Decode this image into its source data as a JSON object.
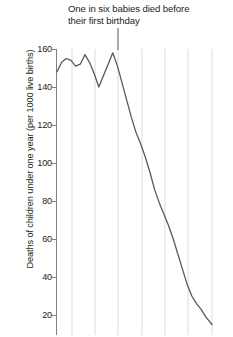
{
  "chart_data": {
    "type": "line",
    "title": "One in six babies died before their first birthday",
    "xlabel": "",
    "ylabel": "Deaths of children under one year (per 1000 live births)",
    "ylim": [
      0,
      166
    ],
    "yticks": [
      160,
      140,
      120,
      100,
      80,
      60,
      40,
      20
    ],
    "ytick_labels": [
      "160",
      "140",
      "120",
      "100",
      "80",
      "60",
      "40",
      "20"
    ],
    "xlim": [
      0,
      100
    ],
    "xticks": [],
    "xtick_labels": [],
    "grid": "vertical-only",
    "legend": "none",
    "line_color": "#58595b",
    "grid_color": "#d9dadb",
    "axis_color": "#808285",
    "annotation": {
      "text": "One in six babies died before their first birthday",
      "points_to_value": 158
    },
    "x": [
      0,
      3,
      6,
      9,
      12,
      15,
      18,
      21,
      24,
      27,
      30,
      33,
      36,
      39,
      42,
      45,
      48,
      51,
      54,
      57,
      60,
      63,
      66,
      69,
      72,
      75,
      78,
      81,
      84,
      87,
      90,
      93,
      96,
      100
    ],
    "values": [
      148,
      153,
      155,
      154,
      151,
      152,
      157,
      153,
      147,
      140,
      146,
      152,
      158,
      151,
      142,
      133,
      124,
      116,
      110,
      103,
      95,
      86,
      79,
      73,
      67,
      60,
      52,
      44,
      36,
      30,
      26,
      23,
      19,
      15
    ],
    "series": [
      {
        "name": "Infant mortality rate",
        "values": [
          148,
          153,
          155,
          154,
          151,
          152,
          157,
          153,
          147,
          140,
          146,
          152,
          158,
          151,
          142,
          133,
          124,
          116,
          110,
          103,
          95,
          86,
          79,
          73,
          67,
          60,
          52,
          44,
          36,
          30,
          26,
          23,
          19,
          15
        ]
      }
    ]
  },
  "axis": {
    "y_title": "Deaths of children under one year (per 1000 live births)",
    "ticks": [
      {
        "label": "160"
      },
      {
        "label": "140"
      },
      {
        "label": "120"
      },
      {
        "label": "100"
      },
      {
        "label": "80"
      },
      {
        "label": "60"
      },
      {
        "label": "40"
      },
      {
        "label": "20"
      }
    ]
  },
  "annotation": {
    "title": "One in six babies died before\ntheir first birthday"
  }
}
